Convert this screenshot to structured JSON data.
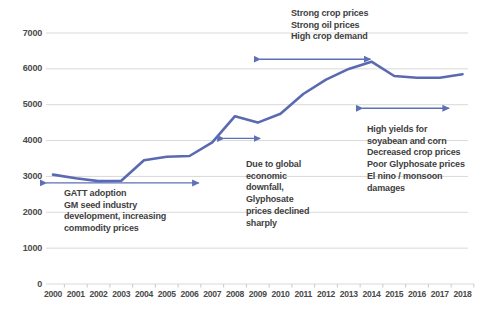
{
  "chart_data": {
    "type": "line",
    "title": "",
    "xlabel": "",
    "ylabel": "",
    "x": [
      2000,
      2001,
      2002,
      2003,
      2004,
      2005,
      2006,
      2007,
      2008,
      2009,
      2010,
      2011,
      2012,
      2013,
      2014,
      2015,
      2016,
      2017,
      2018
    ],
    "series": [
      {
        "name": "price-trend",
        "values": [
          3050,
          2950,
          2870,
          2880,
          3450,
          3550,
          3570,
          3950,
          4680,
          4500,
          4750,
          5300,
          5700,
          6000,
          6200,
          5800,
          5750,
          5750,
          5850
        ]
      }
    ],
    "ylim": [
      0,
      7000
    ],
    "yticks": [
      0,
      1000,
      2000,
      3000,
      4000,
      5000,
      6000,
      7000
    ],
    "grid": true,
    "legend": false,
    "line_color": "#5a6ab0",
    "arrow_color": "#5c6fb8",
    "grid_color": "#d9d9d9",
    "axis_text_color": "#4a4a4a"
  },
  "annotations": {
    "strong": {
      "lines": [
        "Strong crop prices",
        "Strong oil prices",
        "High crop demand"
      ]
    },
    "gatt": {
      "lines": [
        "GATT adoption",
        "GM seed industry",
        "development, increasing",
        "commodity prices"
      ]
    },
    "global": {
      "lines": [
        "Due to global",
        "economic",
        "downfall,",
        "Glyphosate",
        "prices declined",
        "sharply"
      ]
    },
    "yields": {
      "lines": [
        "High yields for",
        "soyabean and corn",
        "Decreased crop prices",
        "Poor Glyphosate prices",
        "El nino / monsoon",
        "damages"
      ]
    }
  },
  "arrows": [
    {
      "name": "gatt-period-arrow",
      "x1": 1999.7,
      "x2": 2006.4,
      "y": 2820
    },
    {
      "name": "strong-period-arrow",
      "x1": 2009.1,
      "x2": 2013.95,
      "y": 6270
    },
    {
      "name": "downfall-arrow",
      "x1": 2007.5,
      "x2": 2009.1,
      "y": 4060
    },
    {
      "name": "yields-period-arrow",
      "x1": 2013.6,
      "x2": 2017.4,
      "y": 4900
    }
  ]
}
